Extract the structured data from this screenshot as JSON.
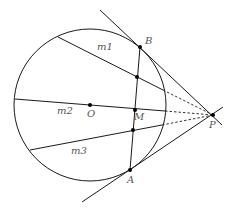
{
  "diagram": {
    "title": "",
    "colors": {
      "stroke": "#1a1a1a",
      "label": "#555555",
      "background": "#ffffff"
    },
    "circle": {
      "center": "O",
      "cx": 90,
      "cy": 105,
      "r": 76
    },
    "points": [
      {
        "id": "B",
        "label": "B",
        "x": 140,
        "y": 47,
        "lx": 145,
        "ly": 44
      },
      {
        "id": "A",
        "label": "A",
        "x": 130,
        "y": 170,
        "lx": 127,
        "ly": 183
      },
      {
        "id": "P",
        "label": "P",
        "x": 213,
        "y": 115,
        "lx": 209,
        "ly": 128
      },
      {
        "id": "M",
        "label": "M",
        "x": 135,
        "y": 110,
        "lx": 134,
        "ly": 120
      },
      {
        "id": "O",
        "label": "O",
        "x": 90,
        "y": 105,
        "lx": 87,
        "ly": 117
      }
    ],
    "chord_points": [
      {
        "id": "m1_AB",
        "x": 137,
        "y": 77
      },
      {
        "id": "m3_AB",
        "x": 133,
        "y": 130
      }
    ],
    "lines": [
      {
        "id": "m1",
        "label": "m1",
        "x1": 58,
        "y1": 37,
        "x2": 163,
        "y2": 90,
        "lx": 97,
        "ly": 50
      },
      {
        "id": "m2",
        "label": "m2",
        "x1": 15,
        "y1": 99,
        "x2": 165,
        "y2": 111,
        "lx": 57,
        "ly": 114
      },
      {
        "id": "m3",
        "label": "m3",
        "x1": 30,
        "y1": 150,
        "x2": 162,
        "y2": 125,
        "lx": 71,
        "ly": 154
      }
    ],
    "dashed": [
      {
        "id": "m1-ext",
        "x1": 163,
        "y1": 90,
        "x2": 213,
        "y2": 115
      },
      {
        "id": "m2-ext",
        "x1": 165,
        "y1": 111,
        "x2": 213,
        "y2": 115
      },
      {
        "id": "m3-ext",
        "x1": 162,
        "y1": 125,
        "x2": 213,
        "y2": 115
      }
    ],
    "tangents": [
      {
        "id": "tangent-PB",
        "x1": 100,
        "y1": 10,
        "x2": 222,
        "y2": 125
      },
      {
        "id": "tangent-PA",
        "x1": 82,
        "y1": 202,
        "x2": 223,
        "y2": 107
      }
    ],
    "chord_AB": {
      "x1": 140,
      "y1": 47,
      "x2": 130,
      "y2": 170
    }
  }
}
